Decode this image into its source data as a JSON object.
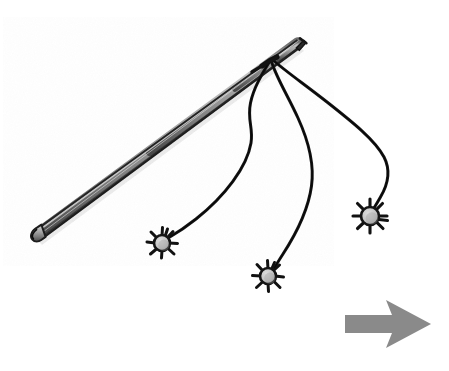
{
  "image": {
    "title": "Hand-drawn rod with three tethered spiked balls and a direction arrow",
    "width": 449,
    "height": 371,
    "background_color": "#ffffff",
    "style": "hand-drawn ink sketch, grayscale"
  },
  "palette": {
    "ink": "#1a1a1a",
    "ink_soft": "#2b2b2b",
    "rod_light": "#b9b9b9",
    "rod_mid": "#8f8f8f",
    "rod_dark": "#5c5c5c",
    "ball_core": "#c9c9c9",
    "ball_core_dark": "#a8a8a8",
    "arrow_gray": "#8a8a8a",
    "paper": "#ffffff"
  },
  "objects": {
    "rod": {
      "name": "rod",
      "label": "Tapered rod / wand",
      "handle_point": [
        34,
        234
      ],
      "tip_point": [
        303,
        42
      ],
      "thickness_handle": 11,
      "thickness_tip": 3,
      "shading": "cylindrical gradient, light upper edge and dark lower edge"
    },
    "junction": {
      "name": "string-junction",
      "label": "Point where the three strings attach to the rod",
      "point": [
        270,
        62
      ]
    },
    "strings": [
      {
        "id": "string-left",
        "label": "Left string",
        "start": [
          270,
          62
        ],
        "end": [
          168,
          238
        ],
        "shape": "S-curve bulging right then sweeping down-left",
        "max_x": 256,
        "stroke_width": 3.0
      },
      {
        "id": "string-middle",
        "label": "Middle string",
        "start": [
          272,
          62
        ],
        "end": [
          275,
          268
        ],
        "shape": "long right bulge then hooking back down-left",
        "max_x": 313,
        "stroke_width": 3.0
      },
      {
        "id": "string-right",
        "label": "Right string",
        "start": [
          274,
          61
        ],
        "end": [
          374,
          208
        ],
        "shape": "wide right bulge curving down into the far ball",
        "max_x": 387,
        "stroke_width": 3.0
      }
    ],
    "balls": [
      {
        "id": "ball-left",
        "label": "Left spiked ball",
        "center": [
          162,
          243
        ],
        "core_radius": 8,
        "spike_length": 7,
        "spike_count": 9,
        "core_color": "#c9c9c9"
      },
      {
        "id": "ball-middle",
        "label": "Middle spiked ball",
        "center": [
          268,
          276
        ],
        "core_radius": 8,
        "spike_length": 7,
        "spike_count": 9,
        "core_color": "#c9c9c9"
      },
      {
        "id": "ball-right",
        "label": "Right spiked ball",
        "center": [
          370,
          216
        ],
        "core_radius": 9,
        "spike_length": 8,
        "spike_count": 9,
        "core_color": "#c9c9c9"
      }
    ],
    "arrow": {
      "id": "direction-arrow",
      "label": "Direction arrow pointing right",
      "color": "#8a8a8a",
      "tail_x": 345,
      "tip_x": 431,
      "center_y": 324,
      "shaft_half_height": 9,
      "head_half_height": 24,
      "direction": "right"
    }
  },
  "annotations": {
    "caption": "",
    "legend": []
  }
}
